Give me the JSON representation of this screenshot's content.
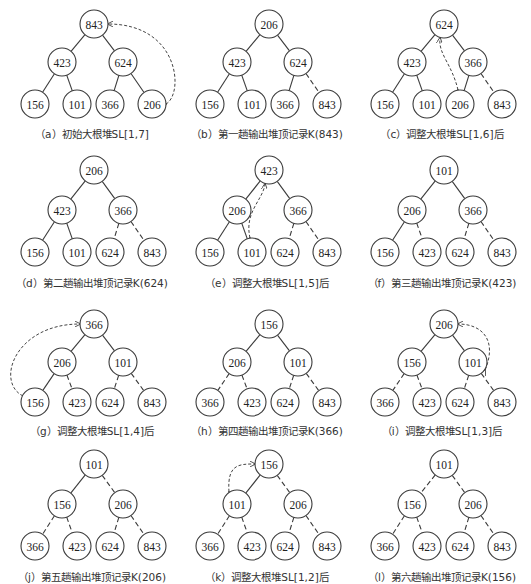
{
  "figure": {
    "panels": [
      {
        "id": "a",
        "caption": "（a）初始大根堆SL[1,7]",
        "nodes": [
          "843",
          "423",
          "624",
          "156",
          "101",
          "366",
          "206"
        ],
        "dashed_to": [],
        "swap": {
          "from": 6,
          "to": 0,
          "shape": "right-arc"
        }
      },
      {
        "id": "b",
        "caption": "（b）第一趟输出堆顶记录K(843)",
        "nodes": [
          "206",
          "423",
          "624",
          "156",
          "101",
          "366",
          "843"
        ],
        "dashed_to": [
          6
        ],
        "swap": null
      },
      {
        "id": "c",
        "caption": "（c）调整大根堆SL[1,6]后",
        "nodes": [
          "624",
          "423",
          "366",
          "156",
          "101",
          "206",
          "843"
        ],
        "dashed_to": [
          6
        ],
        "swap": {
          "from": 5,
          "to": 0,
          "shape": "inner-curve"
        }
      },
      {
        "id": "d",
        "caption": "（d）第二趟输出堆顶记录K(624)",
        "nodes": [
          "206",
          "423",
          "366",
          "156",
          "101",
          "624",
          "843"
        ],
        "dashed_to": [
          5,
          6
        ],
        "swap": null
      },
      {
        "id": "e",
        "caption": "（e）调整大根堆SL[1,5]后",
        "nodes": [
          "423",
          "206",
          "366",
          "156",
          "101",
          "624",
          "843"
        ],
        "dashed_to": [
          5,
          6
        ],
        "swap": {
          "from": 4,
          "to": 0,
          "shape": "inner-curve"
        }
      },
      {
        "id": "f",
        "caption": "（f）第三趟输出堆顶记录K(423)",
        "nodes": [
          "101",
          "206",
          "366",
          "156",
          "423",
          "624",
          "843"
        ],
        "dashed_to": [
          4,
          5,
          6
        ],
        "swap": null
      },
      {
        "id": "g",
        "caption": "（g）调整大根堆SL[1,4]后",
        "nodes": [
          "366",
          "206",
          "101",
          "156",
          "423",
          "624",
          "843"
        ],
        "dashed_to": [
          4,
          5,
          6
        ],
        "swap": {
          "from": 3,
          "to": 0,
          "shape": "left-arc"
        }
      },
      {
        "id": "h",
        "caption": "（h）第四趟输出堆顶记录K(366)",
        "nodes": [
          "156",
          "206",
          "101",
          "366",
          "423",
          "624",
          "843"
        ],
        "dashed_to": [
          3,
          4,
          5,
          6
        ],
        "swap": null
      },
      {
        "id": "i",
        "caption": "（i）调整大根堆SL[1,3]后",
        "nodes": [
          "206",
          "156",
          "101",
          "366",
          "423",
          "624",
          "843"
        ],
        "dashed_to": [
          3,
          4,
          5,
          6
        ],
        "swap": {
          "from": 2,
          "to": 0,
          "shape": "right-arc-small"
        }
      },
      {
        "id": "j",
        "caption": "（j）第五趟输出堆顶记录K(206)",
        "nodes": [
          "101",
          "156",
          "206",
          "366",
          "423",
          "624",
          "843"
        ],
        "dashed_to": [
          2,
          3,
          4,
          5,
          6
        ],
        "swap": null
      },
      {
        "id": "k",
        "caption": "（k）调整大根堆SL[1,2]后",
        "nodes": [
          "156",
          "101",
          "206",
          "366",
          "423",
          "624",
          "843"
        ],
        "dashed_to": [
          2,
          3,
          4,
          5,
          6
        ],
        "swap": {
          "from": 1,
          "to": 0,
          "shape": "left-arc-small"
        }
      },
      {
        "id": "l",
        "caption": "（l）第六趟输出堆顶记录K(156)",
        "nodes": [
          "101",
          "156",
          "206",
          "366",
          "423",
          "624",
          "843"
        ],
        "dashed_to": [
          1,
          2,
          3,
          4,
          5,
          6
        ],
        "swap": null
      }
    ]
  }
}
